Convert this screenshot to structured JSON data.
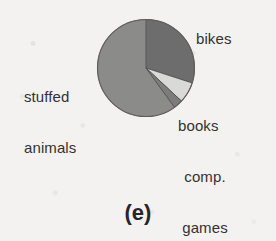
{
  "figure": {
    "caption": "(e)",
    "background_color": "#f3f2f0"
  },
  "labels": {
    "bikes": "bikes",
    "stuffed_line1": "stuffed",
    "stuffed_line2": "animals",
    "books": "books",
    "comp": "comp.",
    "games": "games"
  },
  "chart_data": {
    "type": "pie",
    "title": "",
    "subtitle": "",
    "xlabel": "",
    "ylabel": "",
    "legend_position": "outside-callouts",
    "grid": false,
    "categories": [
      "bikes",
      "books",
      "comp. games",
      "stuffed animals"
    ],
    "values": [
      30,
      7,
      3,
      60
    ],
    "units": "percent",
    "start_angle_deg": 0,
    "direction": "clockwise",
    "slices": [
      {
        "label": "bikes",
        "value": 30,
        "color": "#6d6d6d",
        "start_deg": 0,
        "end_deg": 108
      },
      {
        "label": "books",
        "value": 7,
        "color": "#d9d9d7",
        "start_deg": 108,
        "end_deg": 133
      },
      {
        "label": "comp. games",
        "value": 3,
        "color": "#7b7b7b",
        "start_deg": 133,
        "end_deg": 144
      },
      {
        "label": "stuffed animals",
        "value": 60,
        "color": "#8b8b89",
        "start_deg": 144,
        "end_deg": 360
      }
    ],
    "annotations": [
      "(e)"
    ]
  }
}
